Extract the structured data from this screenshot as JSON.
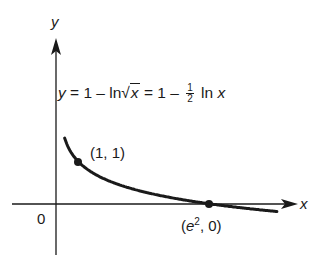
{
  "chart_data": {
    "type": "line",
    "title": "",
    "equation": {
      "lhs": "y",
      "eq1": " = 1 – ln",
      "radicand": "x",
      "eq2": " = 1 – ",
      "frac_num": "1",
      "frac_den": "2",
      "eq3": " ln ",
      "var": "x"
    },
    "equation_text": "y = 1 – ln√x = 1 – ½ ln x",
    "xlabel": "x",
    "ylabel": "y",
    "origin_label": "0",
    "grid": false,
    "series": [
      {
        "name": "y = 1 – (1/2) ln x",
        "x": [
          0.25,
          0.5,
          1,
          2,
          3,
          4,
          5,
          6,
          7.389,
          9,
          10.5
        ],
        "y": [
          1.69,
          1.35,
          1.0,
          0.65,
          0.45,
          0.31,
          0.2,
          0.1,
          0.0,
          -0.1,
          -0.18
        ]
      }
    ],
    "points": [
      {
        "label_pre": "(1, 1)",
        "x": 1,
        "y": 1
      },
      {
        "label_pre": "(",
        "label_e": "e",
        "label_sup": "2",
        "label_post": ", 0)",
        "x": 7.389,
        "y": 0
      }
    ],
    "colors": {
      "curve": "#1a1a1a",
      "axis": "#1a1a1a"
    }
  }
}
